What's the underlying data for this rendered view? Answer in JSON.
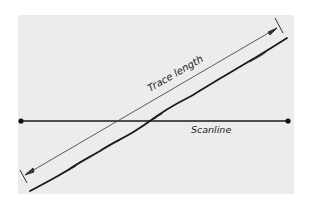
{
  "diagram": {
    "type": "scanline-trace-length-sketch",
    "background_color": "#ffffff",
    "panel_color": "#ececec",
    "ink_color": "#1a1a1a",
    "labels": {
      "trace_length": "Trace length",
      "scanline": "Scanline"
    },
    "elements": [
      {
        "name": "scanline",
        "kind": "horizontal line with dot endpoints"
      },
      {
        "name": "trace",
        "kind": "wavy rough diagonal line (discontinuity trace)"
      },
      {
        "name": "trace-length-dimension",
        "kind": "diagonal dimension line with arrowheads and end ticks"
      }
    ]
  }
}
